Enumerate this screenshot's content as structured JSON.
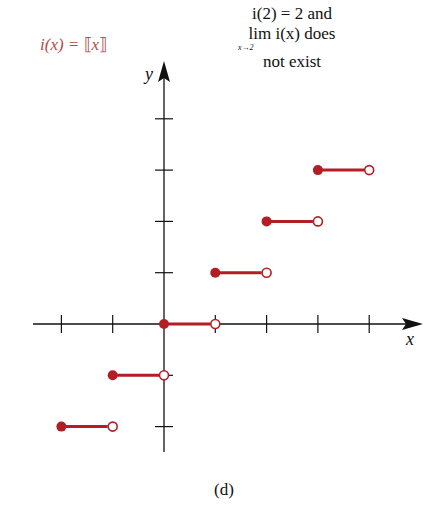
{
  "function_label": {
    "prefix": "i(x) = ",
    "open": "⟦",
    "var": "x",
    "close": "⟧"
  },
  "note": {
    "line1": "i(2) = 2 and",
    "line2": "lim i(x) does",
    "sub": "x→2",
    "line3": "not exist"
  },
  "caption": "(d)",
  "axes": {
    "x_label": "x",
    "y_label": "y"
  },
  "colors": {
    "step": "#b21e24",
    "axis": "#111111",
    "label": "#b24a4a"
  },
  "chart_data": {
    "type": "line",
    "xlabel": "x",
    "ylabel": "y",
    "xlim": [
      -2.1,
      5
    ],
    "ylim": [
      -2.5,
      5.1
    ],
    "grid": false,
    "x_ticks": [
      -2,
      -1,
      0,
      1,
      2,
      3,
      4
    ],
    "y_ticks": [
      -2,
      -1,
      1,
      2,
      3,
      4
    ],
    "series": [
      {
        "name": "step [-2,-1)",
        "x": [
          -2,
          -1
        ],
        "y": [
          -2,
          -2
        ],
        "closed_left": true,
        "open_right": true
      },
      {
        "name": "step [-1,0)",
        "x": [
          -1,
          0
        ],
        "y": [
          -1,
          -1
        ],
        "closed_left": true,
        "open_right": true
      },
      {
        "name": "step [0,1)",
        "x": [
          0,
          1
        ],
        "y": [
          0,
          0
        ],
        "closed_left": true,
        "open_right": true
      },
      {
        "name": "step [1,2)",
        "x": [
          1,
          2
        ],
        "y": [
          1,
          1
        ],
        "closed_left": true,
        "open_right": true
      },
      {
        "name": "step [2,3)",
        "x": [
          2,
          3
        ],
        "y": [
          2,
          2
        ],
        "closed_left": true,
        "open_right": true
      },
      {
        "name": "step [3,4)",
        "x": [
          3,
          4
        ],
        "y": [
          3,
          3
        ],
        "closed_left": true,
        "open_right": true
      }
    ],
    "annotations": [
      "i(x) = [[x]]",
      "i(2) = 2 and lim_{x→2} i(x) does not exist",
      "(d)"
    ]
  }
}
